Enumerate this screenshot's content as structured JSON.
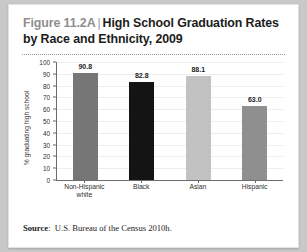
{
  "figure": {
    "number": "Figure 11.2A",
    "separator": "|",
    "title": "High School Graduation Rates by Race and Ethnicity, 2009",
    "source_label": "Source",
    "source_separator": ":",
    "source_text": "U.S. Bureau of the Census 2010h."
  },
  "chart_data": {
    "type": "bar",
    "title": "High School Graduation Rates by Race and Ethnicity, 2009",
    "xlabel": "",
    "ylabel": "% graduating high school",
    "categories": [
      "Non-Hispanic white",
      "Black",
      "Asian",
      "Hispanic"
    ],
    "values": [
      90.8,
      82.8,
      88.1,
      63.0
    ],
    "value_labels": [
      "90.8",
      "82.8",
      "88.1",
      "63.0"
    ],
    "bar_colors": [
      "#767676",
      "#141414",
      "#c2c2c2",
      "#8f8f8f"
    ],
    "ylim": [
      0,
      100
    ],
    "yticks": [
      0,
      10,
      20,
      30,
      40,
      50,
      60,
      70,
      80,
      90,
      100
    ],
    "ytick_labels": [
      "0",
      "10",
      "20",
      "30",
      "40",
      "50",
      "60",
      "70",
      "80",
      "90",
      "100"
    ],
    "grid": true,
    "legend": "none"
  }
}
